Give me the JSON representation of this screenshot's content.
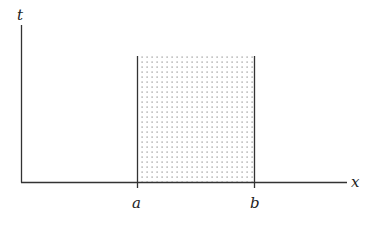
{
  "diagram": {
    "axes": {
      "x_label": "x",
      "y_label": "t"
    },
    "markers": {
      "a_label": "a",
      "b_label": "b"
    },
    "region": {
      "description": "dotted shaded strip between a and b",
      "fill_pattern": "dots",
      "dot_color": "#8a8a8a",
      "line_color": "#333333"
    }
  }
}
